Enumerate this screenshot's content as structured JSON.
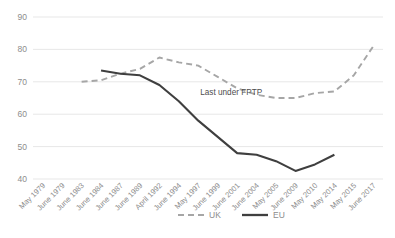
{
  "chart_data": {
    "type": "line",
    "title": "",
    "subtitle": "",
    "xlabel": "",
    "ylabel": "",
    "ylim": [
      40,
      90
    ],
    "yticks": [
      40,
      50,
      60,
      70,
      80,
      90
    ],
    "grid": true,
    "legend_position": "bottom",
    "categories": [
      "May 1979",
      "June 1979",
      "June 1983",
      "June 1984",
      "June 1987",
      "June 1989",
      "April 1992",
      "June 1994",
      "May 1997",
      "June 1999",
      "June 2001",
      "June 2004",
      "May 2005",
      "June 2009",
      "May 2010",
      "May 2014",
      "May 2015",
      "June 2017"
    ],
    "series": [
      {
        "name": "UK",
        "style": "dashed",
        "color": "#a6a6a6",
        "values": [
          81,
          null,
          70,
          70.5,
          72.5,
          74,
          77.5,
          76,
          75,
          71.5,
          68,
          66,
          65,
          65,
          66.5,
          67,
          72,
          81
        ]
      },
      {
        "name": "EU",
        "style": "solid",
        "color": "#3f3f3f",
        "values": [
          null,
          80,
          null,
          73.5,
          72.5,
          72,
          69,
          64,
          58,
          53,
          48,
          47.5,
          45.5,
          42.5,
          44.5,
          47.5,
          null,
          null
        ]
      }
    ],
    "annotations": [
      {
        "text": "Last under FPTP",
        "x_category": "May 1997",
        "y_value": 66
      }
    ],
    "legend": [
      {
        "label": "UK",
        "color": "#a6a6a6",
        "style": "dashed"
      },
      {
        "label": "EU",
        "color": "#3f3f3f",
        "style": "solid"
      }
    ]
  }
}
